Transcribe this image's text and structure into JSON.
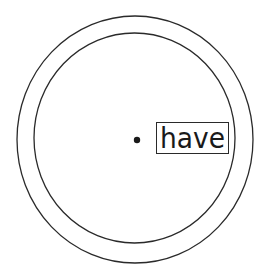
{
  "diagram": {
    "label": "have",
    "colors": {
      "background": "#ffffff",
      "stroke": "#2a2a2a",
      "text": "#1a1a1a"
    },
    "outer_circle": {
      "cx": 135,
      "cy": 139.5,
      "rx": 118,
      "ry": 123.5
    },
    "inner_circle": {
      "cx": 134.5,
      "cy": 138,
      "rx": 100.5,
      "ry": 105
    },
    "center_dot": {
      "cx": 137,
      "cy": 140,
      "r": 3
    },
    "label_box": {
      "x": 156,
      "y": 122,
      "width": 72,
      "height": 31
    }
  }
}
